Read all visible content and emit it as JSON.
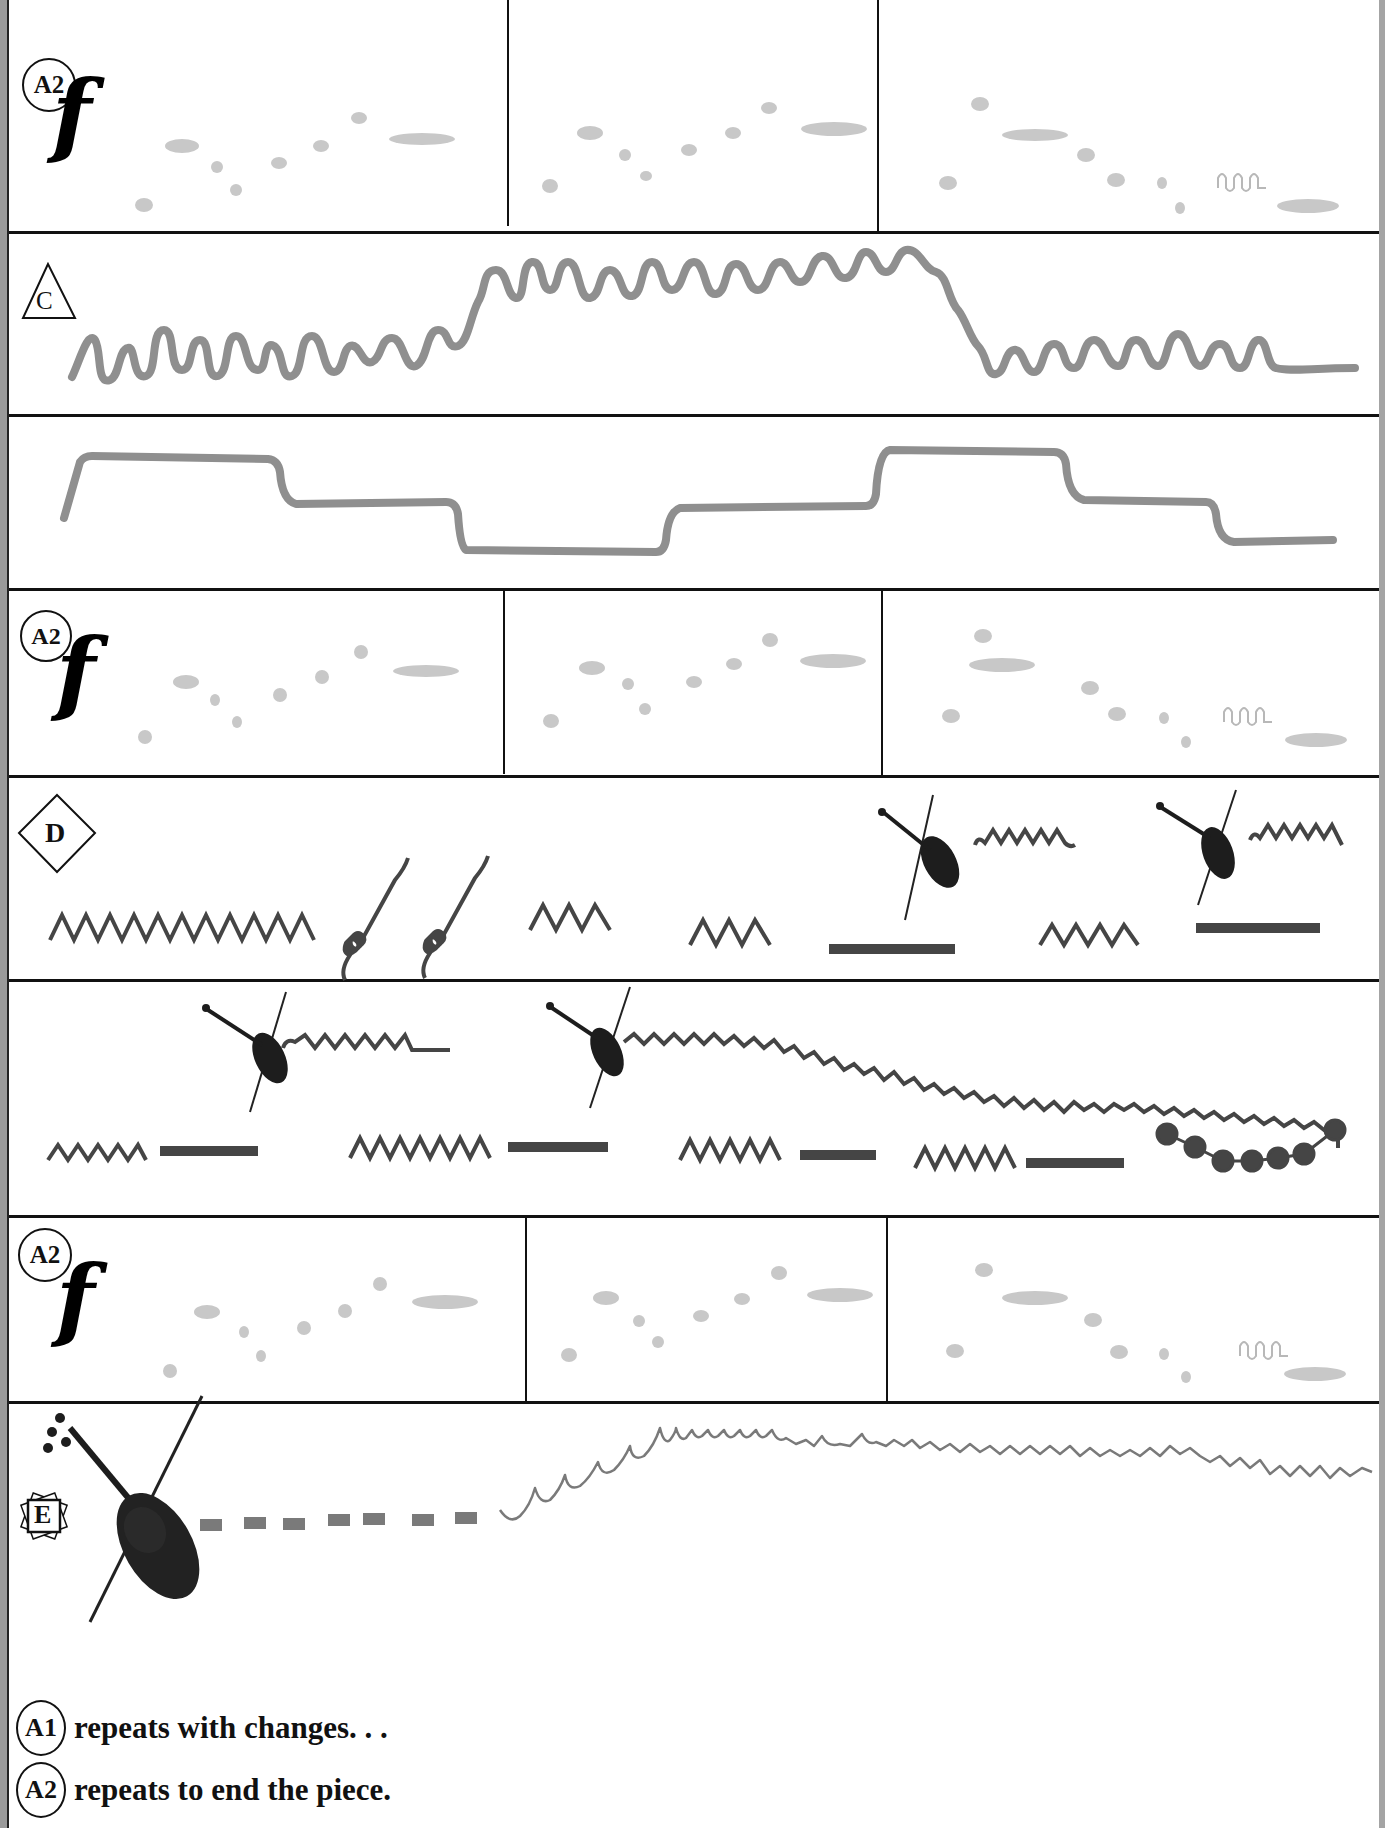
{
  "page": {
    "kind": "listening map (music form chart)",
    "colors": {
      "rule": "#111111",
      "note_light_gray": "#c8c8c8",
      "line_mid_gray": "#8f8f8f",
      "dark_shape": "#454545",
      "edge_gray": "#9a9a9a"
    }
  },
  "rows": [
    {
      "id": "row-a2-1",
      "section_label": "A2",
      "badge_shape": "circle",
      "dynamic": "f",
      "panels": 3,
      "content": "light gray note ellipses rising in three measures, ends with small wavy ornament"
    },
    {
      "id": "row-c-1",
      "section_label": "C",
      "badge_shape": "triangle",
      "content": "thick gray looping melodic wave rising then falling"
    },
    {
      "id": "row-c-2",
      "section_label": "",
      "content": "thick gray stepped line (plateaus)"
    },
    {
      "id": "row-a2-2",
      "section_label": "A2",
      "badge_shape": "circle",
      "dynamic": "f",
      "panels": 3,
      "content": "light gray note ellipses (repeat of A2)"
    },
    {
      "id": "row-d-1",
      "section_label": "D",
      "badge_shape": "diamond",
      "content": "zigzags, spirals, dashes and two violin icons with small waves"
    },
    {
      "id": "row-d-2",
      "section_label": "",
      "content": "violin icons with long wavy line ending in a chain of dots; zigzag + dash pairs"
    },
    {
      "id": "row-a2-3",
      "section_label": "A2",
      "badge_shape": "circle",
      "dynamic": "f",
      "panels": 3,
      "content": "light gray note ellipses (repeat of A2)"
    },
    {
      "id": "row-e",
      "section_label": "E",
      "badge_shape": "ornate-square",
      "content": "large violin with dashed line then rising scalloped wave"
    }
  ],
  "footer": {
    "lines": [
      {
        "badge": "A1",
        "text": "repeats with changes. . ."
      },
      {
        "badge": "A2",
        "text": "repeats to end the piece."
      }
    ]
  },
  "labels": {
    "a2": "A2",
    "c": "C",
    "d": "D",
    "e": "E",
    "forte": "f"
  }
}
